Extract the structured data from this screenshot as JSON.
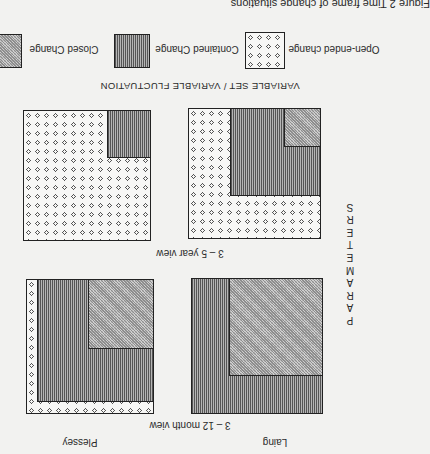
{
  "figure": {
    "caption": "Figure 2  Time frame of change situations",
    "orientation": "rotated 180 degrees",
    "legend": [
      {
        "key": "open",
        "label": "Open-ended change",
        "pattern": "dots"
      },
      {
        "key": "contained",
        "label": "Contained Change",
        "pattern": "vertical-lines"
      },
      {
        "key": "closed",
        "label": "Closed Change",
        "pattern": "fine-crosshatch"
      }
    ],
    "x_axis_label": "VARIABLE SET / VARIABLE FLUCTUATION",
    "y_axis_label": "PARAMETERS",
    "rows": [
      {
        "label": "3 – 5 year view"
      },
      {
        "label": "3 – 12 month view"
      }
    ],
    "columns": [
      {
        "label": "Laing"
      },
      {
        "label": "Plessey"
      }
    ],
    "panels": [
      {
        "company": "Laing",
        "view": "3 – 5 year view",
        "composition": "open-ended dominant with contained corner and small closed corner"
      },
      {
        "company": "Plessey",
        "view": "3 – 5 year view",
        "composition": "mostly open-ended with small contained corner"
      },
      {
        "company": "Laing",
        "view": "3 – 12 month view",
        "composition": "closed dominant with contained border"
      },
      {
        "company": "Plessey",
        "view": "3 – 12 month view",
        "composition": "contained with closed corner and thin open-ended border"
      }
    ],
    "colors": {
      "ink": "#222222",
      "paper": "#f2f2f0",
      "contained_fill": "#8a8a8a",
      "closed_fill": "#b8b8b8"
    }
  }
}
